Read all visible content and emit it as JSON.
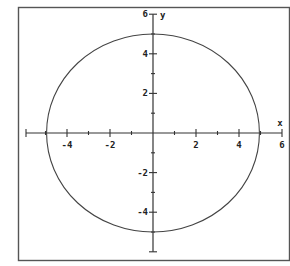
{
  "chart_data": {
    "type": "line",
    "title": "",
    "xlabel": "x",
    "ylabel": "y",
    "xlim": [
      -6,
      6
    ],
    "ylim": [
      -6,
      6
    ],
    "grid": false,
    "x_ticks": [
      -4,
      -2,
      2,
      4,
      6
    ],
    "y_ticks": [
      6,
      4,
      2,
      -2,
      -4
    ],
    "x_tick_labels": [
      "-4",
      "-2",
      "2",
      "4",
      "6"
    ],
    "y_tick_labels": [
      "6",
      "4",
      "2",
      "-2",
      "-4"
    ],
    "minor_tick_step": 1,
    "series": [
      {
        "name": "circle",
        "shape": "circle",
        "center": [
          0,
          0
        ],
        "radius": 5,
        "points": [
          [
            5,
            0
          ],
          [
            4,
            3
          ],
          [
            3,
            4
          ],
          [
            0,
            5
          ],
          [
            -3,
            4
          ],
          [
            -4,
            3
          ],
          [
            -5,
            0
          ],
          [
            -4,
            -3
          ],
          [
            -3,
            -4
          ],
          [
            0,
            -5
          ],
          [
            3,
            -4
          ],
          [
            4,
            -3
          ]
        ]
      }
    ]
  },
  "colors": {
    "background": "#ffffff",
    "frame": "#555555",
    "axes": "#333333",
    "curve": "#444444"
  }
}
